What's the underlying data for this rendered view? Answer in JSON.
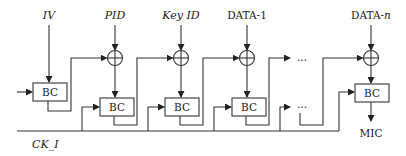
{
  "diagram": {
    "type": "block-diagram",
    "inputs": [
      {
        "id": "iv",
        "label": "IV",
        "italic": true
      },
      {
        "id": "pid",
        "label": "PID",
        "italic": true
      },
      {
        "id": "keyid",
        "label": "Key ID",
        "italic": true
      },
      {
        "id": "data1",
        "label": "DATA-1",
        "italic": false
      },
      {
        "id": "datan",
        "label": "DATA-n",
        "label_prefix": "DATA-",
        "label_suffix": "n",
        "italic": false
      }
    ],
    "blocks": [
      {
        "id": "bc1",
        "label": "BC"
      },
      {
        "id": "bc2",
        "label": "BC"
      },
      {
        "id": "bc3",
        "label": "BC"
      },
      {
        "id": "bc4",
        "label": "BC"
      },
      {
        "id": "bc5",
        "label": "BC"
      }
    ],
    "xor_nodes": 4,
    "ellipsis": [
      "...",
      "..."
    ],
    "clock_label": "CK_I",
    "output_label": "MIC"
  }
}
